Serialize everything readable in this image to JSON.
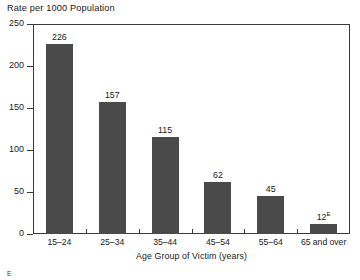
{
  "chart_data": {
    "type": "bar",
    "title": "Rate per 1000 Population",
    "xlabel": "Age Group of Victim (years)",
    "ylabel": "",
    "categories": [
      "15–24",
      "25–34",
      "35–44",
      "45–54",
      "55–64",
      "65 and over"
    ],
    "values": [
      226,
      157,
      115,
      62,
      45,
      12
    ],
    "value_labels": [
      "226",
      "157",
      "115",
      "62",
      "45",
      "12"
    ],
    "value_label_superscripts": [
      "",
      "",
      "",
      "",
      "",
      "E"
    ],
    "ylim": [
      0,
      250
    ],
    "ytick_values": [
      0,
      50,
      100,
      150,
      200,
      250
    ],
    "ytick_labels": [
      "0",
      "50",
      "100",
      "150",
      "200",
      "250"
    ],
    "grid": false,
    "legend": false,
    "legend_position": "none",
    "bar_color": "#4a4a4a",
    "axis_color": "#3a3a3a",
    "text_color": "#202020",
    "background_color": "#ffffff"
  },
  "footnote": {
    "marker": "E"
  }
}
